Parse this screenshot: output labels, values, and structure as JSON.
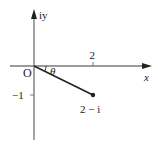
{
  "diagram": {
    "axes": {
      "x_label": "x",
      "y_label": "iy",
      "origin_label": "O"
    },
    "ticks": {
      "x": [
        {
          "value": 2,
          "label": "2"
        }
      ],
      "y": [
        {
          "value": -1,
          "label": "−1"
        }
      ]
    },
    "point": {
      "re": 2,
      "im": -1,
      "label": "2 − i"
    },
    "angle_label": "θ",
    "colors": {
      "axis": "#7a7a7a",
      "segment": "#222222",
      "text": "#222222"
    }
  }
}
